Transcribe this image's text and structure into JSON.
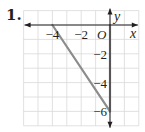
{
  "problem": {
    "number": "1."
  },
  "chart_data": {
    "type": "line",
    "title": "",
    "xlabel": "x",
    "ylabel": "y",
    "origin_label": "O",
    "xlim": [
      -6,
      2
    ],
    "ylim": [
      -7,
      1
    ],
    "grid": true,
    "x_ticks": [
      {
        "value": -4,
        "label": "−4"
      },
      {
        "value": -2,
        "label": "−2"
      }
    ],
    "y_ticks": [
      {
        "value": -2,
        "label": "−2"
      },
      {
        "value": -4,
        "label": "−4"
      },
      {
        "value": -6,
        "label": "−6"
      }
    ],
    "series": [
      {
        "name": "triangle-segment",
        "points": [
          [
            -4,
            0
          ],
          [
            0,
            -6
          ]
        ]
      },
      {
        "name": "y-axis-segment",
        "points": [
          [
            0,
            0
          ],
          [
            0,
            -6
          ]
        ]
      }
    ],
    "colors": {
      "grid": "#d9d9d9",
      "axis": "#231f20",
      "segment": "#8c8c8c"
    }
  }
}
